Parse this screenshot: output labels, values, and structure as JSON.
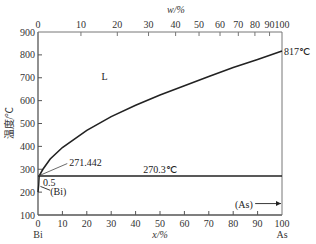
{
  "chart_data": {
    "type": "line",
    "title": "",
    "top_axis_label": "w/%",
    "top_ticks": [
      "0",
      "10",
      "20",
      "30",
      "40",
      "50",
      "60",
      "70",
      "80",
      "90",
      "100"
    ],
    "top_ticks_x_mole_percent": [
      0,
      17.6,
      32.5,
      45.3,
      56.4,
      66.0,
      74.6,
      82.1,
      88.9,
      94.9,
      100
    ],
    "xlabel": "x/%",
    "xticks": [
      "0",
      "10",
      "20",
      "30",
      "40",
      "50",
      "60",
      "70",
      "80",
      "90",
      "100"
    ],
    "ylabel": "温度/℃",
    "yticks": [
      "100",
      "200",
      "300",
      "400",
      "500",
      "600",
      "700",
      "800",
      "900"
    ],
    "xlim": [
      0,
      100
    ],
    "ylim": [
      100,
      900
    ],
    "left_component": "Bi",
    "right_component": "As",
    "grid": false,
    "series": [
      {
        "name": "liquidus",
        "x": [
          0.5,
          2,
          5,
          10,
          20,
          30,
          40,
          50,
          60,
          70,
          80,
          90,
          100
        ],
        "y": [
          271.4,
          300,
          345,
          395,
          470,
          530,
          580,
          625,
          665,
          705,
          745,
          780,
          817
        ]
      },
      {
        "name": "eutectic line",
        "x": [
          0,
          100
        ],
        "y": [
          270.3,
          270.3
        ]
      },
      {
        "name": "Bi solvus",
        "x": [
          0.5,
          0.3,
          0
        ],
        "y": [
          270.3,
          230,
          200
        ]
      }
    ],
    "annotations": [
      {
        "text": "L",
        "x": 26,
        "y": 690
      },
      {
        "text": "817℃",
        "x": 100,
        "y": 817
      },
      {
        "text": "271.442",
        "x": 12,
        "y": 330
      },
      {
        "text": "270.3℃",
        "x": 50,
        "y": 285
      },
      {
        "text": "0.5",
        "x": 2,
        "y": 245
      },
      {
        "text": "(Bi)",
        "x": 6,
        "y": 205
      },
      {
        "text": "(As)",
        "x": 90,
        "y": 150
      }
    ]
  },
  "labels": {
    "top_axis": "w/%",
    "bottom_axis": "x/%",
    "y_axis": "温度/℃",
    "left_comp": "Bi",
    "right_comp": "As",
    "liquid": "L",
    "t_as": "817℃",
    "t_bi": "271.442",
    "t_eut": "270.3℃",
    "sol_bi_val": "0.5",
    "phase_bi": "(Bi)",
    "phase_as": "(As)"
  }
}
